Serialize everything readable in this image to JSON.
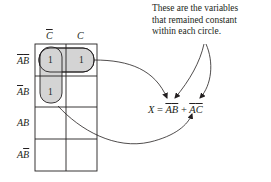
{
  "annotation": {
    "lines": [
      "These are the variables",
      "that remained constant",
      "within each circle."
    ]
  },
  "kmap": {
    "column_headers": [
      {
        "var": "C",
        "complement": true
      },
      {
        "var": "C",
        "complement": false
      }
    ],
    "row_headers": [
      {
        "a": "A",
        "a_bar": true,
        "b": "B",
        "b_bar": true
      },
      {
        "a": "A",
        "a_bar": true,
        "b": "B",
        "b_bar": false
      },
      {
        "a": "A",
        "a_bar": false,
        "b": "B",
        "b_bar": false
      },
      {
        "a": "A",
        "a_bar": false,
        "b": "B",
        "b_bar": true
      }
    ],
    "cells": [
      [
        "1",
        "1"
      ],
      [
        "1",
        ""
      ],
      [
        "",
        ""
      ],
      [
        "",
        ""
      ]
    ],
    "groups": [
      {
        "name": "row-group",
        "cells": [
          [
            0,
            0
          ],
          [
            0,
            1
          ]
        ],
        "term": "A̅B̅"
      },
      {
        "name": "column-group",
        "cells": [
          [
            0,
            0
          ],
          [
            1,
            0
          ]
        ],
        "term": "A̅C̅"
      }
    ],
    "fill_color": "#d4d4d4"
  },
  "expression": {
    "lhs": "X",
    "equals": "=",
    "term1_a": "A",
    "term1_b": "B",
    "plus": "+",
    "term2_a": "A",
    "term2_c": "C"
  },
  "colors": {
    "line": "#231f20",
    "group_fill": "#d4d4d4",
    "arrow": "#231f20"
  }
}
